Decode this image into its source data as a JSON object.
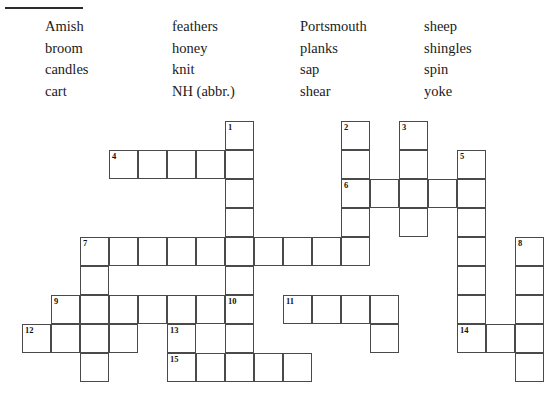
{
  "page": {
    "type": "word-bank-crossword"
  },
  "divider": {
    "name": "top-rule"
  },
  "wordbank": {
    "columns": [
      {
        "words": [
          "Amish",
          "broom",
          "candles",
          "cart"
        ]
      },
      {
        "words": [
          "feathers",
          "honey",
          "knit",
          "NH (abbr.)"
        ]
      },
      {
        "words": [
          "Portsmouth",
          "planks",
          "sap",
          "shear"
        ]
      },
      {
        "words": [
          "sheep",
          "shingles",
          "spin",
          "yoke"
        ]
      }
    ],
    "all_words": [
      "Amish",
      "broom",
      "candles",
      "cart",
      "feathers",
      "honey",
      "knit",
      "NH (abbr.)",
      "Portsmouth",
      "planks",
      "sap",
      "shear",
      "sheep",
      "shingles",
      "spin",
      "yoke"
    ]
  },
  "grid": {
    "cell_size": 29,
    "origin_x": 22,
    "origin_y": 121,
    "colors": {
      "border": "#4a4a4a",
      "fill": "#ffffff",
      "number": "#111111"
    },
    "cells": [
      {
        "c": 7,
        "r": 0,
        "n": "1"
      },
      {
        "c": 7,
        "r": 1,
        "n": ""
      },
      {
        "c": 7,
        "r": 2,
        "n": ""
      },
      {
        "c": 7,
        "r": 3,
        "n": ""
      },
      {
        "c": 3,
        "r": 1,
        "n": "4"
      },
      {
        "c": 4,
        "r": 1,
        "n": ""
      },
      {
        "c": 5,
        "r": 1,
        "n": ""
      },
      {
        "c": 6,
        "r": 1,
        "n": ""
      },
      {
        "c": 11,
        "r": 0,
        "n": "2"
      },
      {
        "c": 11,
        "r": 1,
        "n": ""
      },
      {
        "c": 11,
        "r": 2,
        "n": "6"
      },
      {
        "c": 11,
        "r": 3,
        "n": ""
      },
      {
        "c": 11,
        "r": 4,
        "n": ""
      },
      {
        "c": 13,
        "r": 0,
        "n": "3"
      },
      {
        "c": 13,
        "r": 1,
        "n": ""
      },
      {
        "c": 13,
        "r": 2,
        "n": ""
      },
      {
        "c": 13,
        "r": 3,
        "n": ""
      },
      {
        "c": 15,
        "r": 1,
        "n": "5"
      },
      {
        "c": 15,
        "r": 2,
        "n": ""
      },
      {
        "c": 15,
        "r": 3,
        "n": ""
      },
      {
        "c": 15,
        "r": 4,
        "n": ""
      },
      {
        "c": 15,
        "r": 5,
        "n": ""
      },
      {
        "c": 15,
        "r": 6,
        "n": ""
      },
      {
        "c": 15,
        "r": 7,
        "n": ""
      },
      {
        "c": 12,
        "r": 2,
        "n": ""
      },
      {
        "c": 13,
        "r": 2,
        "n": ""
      },
      {
        "c": 14,
        "r": 2,
        "n": ""
      },
      {
        "c": 2,
        "r": 4,
        "n": "7"
      },
      {
        "c": 3,
        "r": 4,
        "n": ""
      },
      {
        "c": 4,
        "r": 4,
        "n": ""
      },
      {
        "c": 5,
        "r": 4,
        "n": ""
      },
      {
        "c": 6,
        "r": 4,
        "n": ""
      },
      {
        "c": 7,
        "r": 4,
        "n": ""
      },
      {
        "c": 8,
        "r": 4,
        "n": ""
      },
      {
        "c": 9,
        "r": 4,
        "n": ""
      },
      {
        "c": 10,
        "r": 4,
        "n": ""
      },
      {
        "c": 11,
        "r": 4,
        "n": ""
      },
      {
        "c": 17,
        "r": 4,
        "n": "8"
      },
      {
        "c": 17,
        "r": 5,
        "n": ""
      },
      {
        "c": 17,
        "r": 6,
        "n": ""
      },
      {
        "c": 17,
        "r": 7,
        "n": ""
      },
      {
        "c": 17,
        "r": 8,
        "n": ""
      },
      {
        "c": 1,
        "r": 6,
        "n": "9"
      },
      {
        "c": 2,
        "r": 6,
        "n": ""
      },
      {
        "c": 3,
        "r": 6,
        "n": ""
      },
      {
        "c": 4,
        "r": 6,
        "n": ""
      },
      {
        "c": 5,
        "r": 6,
        "n": ""
      },
      {
        "c": 6,
        "r": 6,
        "n": ""
      },
      {
        "c": 7,
        "r": 6,
        "n": "10"
      },
      {
        "c": 9,
        "r": 6,
        "n": "11"
      },
      {
        "c": 10,
        "r": 6,
        "n": ""
      },
      {
        "c": 11,
        "r": 6,
        "n": ""
      },
      {
        "c": 12,
        "r": 6,
        "n": ""
      },
      {
        "c": 2,
        "r": 5,
        "n": ""
      },
      {
        "c": 2,
        "r": 7,
        "n": ""
      },
      {
        "c": 2,
        "r": 8,
        "n": ""
      },
      {
        "c": 7,
        "r": 5,
        "n": ""
      },
      {
        "c": 7,
        "r": 7,
        "n": ""
      },
      {
        "c": 12,
        "r": 7,
        "n": ""
      },
      {
        "c": 0,
        "r": 7,
        "n": "12"
      },
      {
        "c": 1,
        "r": 7,
        "n": ""
      },
      {
        "c": 3,
        "r": 7,
        "n": ""
      },
      {
        "c": 5,
        "r": 7,
        "n": "13"
      },
      {
        "c": 15,
        "r": 7,
        "n": "14"
      },
      {
        "c": 16,
        "r": 7,
        "n": ""
      },
      {
        "c": 5,
        "r": 8,
        "n": "15"
      },
      {
        "c": 6,
        "r": 8,
        "n": ""
      },
      {
        "c": 7,
        "r": 8,
        "n": ""
      },
      {
        "c": 8,
        "r": 8,
        "n": ""
      },
      {
        "c": 9,
        "r": 8,
        "n": ""
      }
    ],
    "numbered": [
      "1",
      "2",
      "3",
      "4",
      "5",
      "6",
      "7",
      "8",
      "9",
      "10",
      "11",
      "12",
      "13",
      "14",
      "15"
    ]
  }
}
